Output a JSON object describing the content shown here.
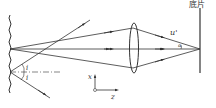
{
  "diagram": {
    "type": "optical-ray-diagram",
    "labels": {
      "film": "底片",
      "u_prime": "u'",
      "alpha": "α",
      "i_upper": "i",
      "i_lower": "i",
      "axis_x": "x",
      "axis_z": "z"
    },
    "elements": [
      "rough-surface",
      "convex-lens",
      "film-plane",
      "coordinate-axes"
    ],
    "colors": {
      "line": "#333333",
      "background": "#ffffff"
    }
  }
}
